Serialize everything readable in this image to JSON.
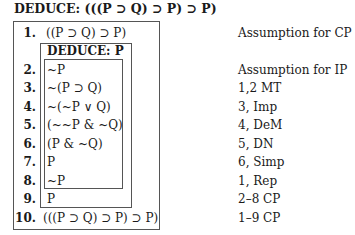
{
  "title": "DEDUCE: (((P ⊃ Q) ⊃ P) ⊃ P)",
  "subproof": {
    "header": "DEDUCE: P"
  },
  "lines": [
    {
      "num": "1.",
      "formula": "((P ⊃ Q) ⊃ P)",
      "justification": "Assumption for CP"
    },
    {
      "num": "2.",
      "formula": "~P",
      "justification": "Assumption for IP"
    },
    {
      "num": "3.",
      "formula": "~(P ⊃ Q)",
      "justification": "1,2 MT"
    },
    {
      "num": "4.",
      "formula": "~(~P ∨ Q)",
      "justification": "3, Imp"
    },
    {
      "num": "5.",
      "formula": "(~~P & ~Q)",
      "justification": "4, DeM"
    },
    {
      "num": "6.",
      "formula": "(P & ~Q)",
      "justification": "5, DN"
    },
    {
      "num": "7.",
      "formula": "P",
      "justification": "6, Simp"
    },
    {
      "num": "8.",
      "formula": "~P",
      "justification": "1, Rep"
    },
    {
      "num": "9.",
      "formula": "P",
      "justification": "2–8 CP"
    },
    {
      "num": "10.",
      "formula": "(((P ⊃ Q) ⊃ P) ⊃ P)",
      "justification": "1–9 CP"
    }
  ]
}
